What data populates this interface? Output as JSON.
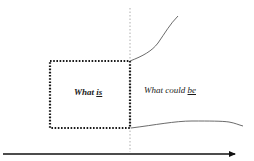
{
  "diagram": {
    "type": "gap-analysis",
    "labels": {
      "current_state": {
        "prefix": "What ",
        "emphasis": "is"
      },
      "future_state": {
        "prefix": "What could ",
        "emphasis": "be"
      }
    },
    "elements": {
      "current_box": {
        "style": "dotted",
        "x": 50,
        "y": 61,
        "width": 80,
        "height": 67
      },
      "divider": {
        "style": "dotted",
        "x": 130,
        "y1": 8,
        "y2": 152
      },
      "upper_curve": "rising",
      "lower_curve": "flat",
      "time_axis": {
        "direction": "right",
        "y": 154,
        "x1": 3,
        "x2": 237
      }
    },
    "colors": {
      "box": "#1a1a1a",
      "divider": "#9a9a9a",
      "curves": "#5a5a5a",
      "axis": "#111111"
    }
  }
}
